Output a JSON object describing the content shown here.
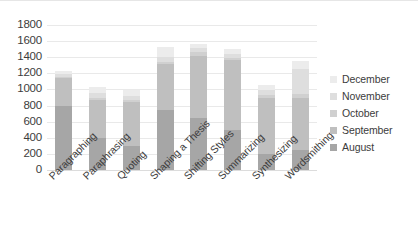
{
  "chart_data": {
    "type": "bar",
    "stacked": true,
    "title": "",
    "xlabel": "",
    "ylabel": "",
    "ylim": [
      0,
      1800
    ],
    "ytick_step": 200,
    "yticks": [
      1800,
      1600,
      1400,
      1200,
      1000,
      800,
      600,
      400,
      200,
      0
    ],
    "grid": true,
    "legend_position": "right",
    "categories": [
      "Paragraphing",
      "Paraphrasing",
      "Quoting",
      "Shaping a Thesis",
      "Shifting Styles",
      "Summarizing",
      "Synthesizing",
      "Wordsmithing"
    ],
    "series": [
      {
        "name": "August",
        "color": "#a6a6a6",
        "values": [
          800,
          400,
          300,
          750,
          650,
          500,
          200,
          250
        ]
      },
      {
        "name": "September",
        "color": "#bfbfbf",
        "values": [
          340,
          470,
          550,
          560,
          770,
          860,
          700,
          650
        ]
      },
      {
        "name": "October",
        "color": "#d0d0d0",
        "values": [
          20,
          30,
          20,
          30,
          50,
          30,
          30,
          40
        ]
      },
      {
        "name": "November",
        "color": "#dedede",
        "values": [
          30,
          60,
          50,
          60,
          50,
          50,
          60,
          320
        ]
      },
      {
        "name": "December",
        "color": "#ececec",
        "values": [
          40,
          70,
          70,
          130,
          40,
          60,
          60,
          90
        ]
      }
    ],
    "totals": [
      1230,
      1030,
      990,
      1530,
      1560,
      1500,
      1050,
      1350
    ]
  },
  "legend": {
    "items": [
      {
        "label": "December",
        "color": "#ececec"
      },
      {
        "label": "November",
        "color": "#dedede"
      },
      {
        "label": "October",
        "color": "#d0d0d0"
      },
      {
        "label": "September",
        "color": "#bfbfbf"
      },
      {
        "label": "August",
        "color": "#a6a6a6"
      }
    ]
  }
}
